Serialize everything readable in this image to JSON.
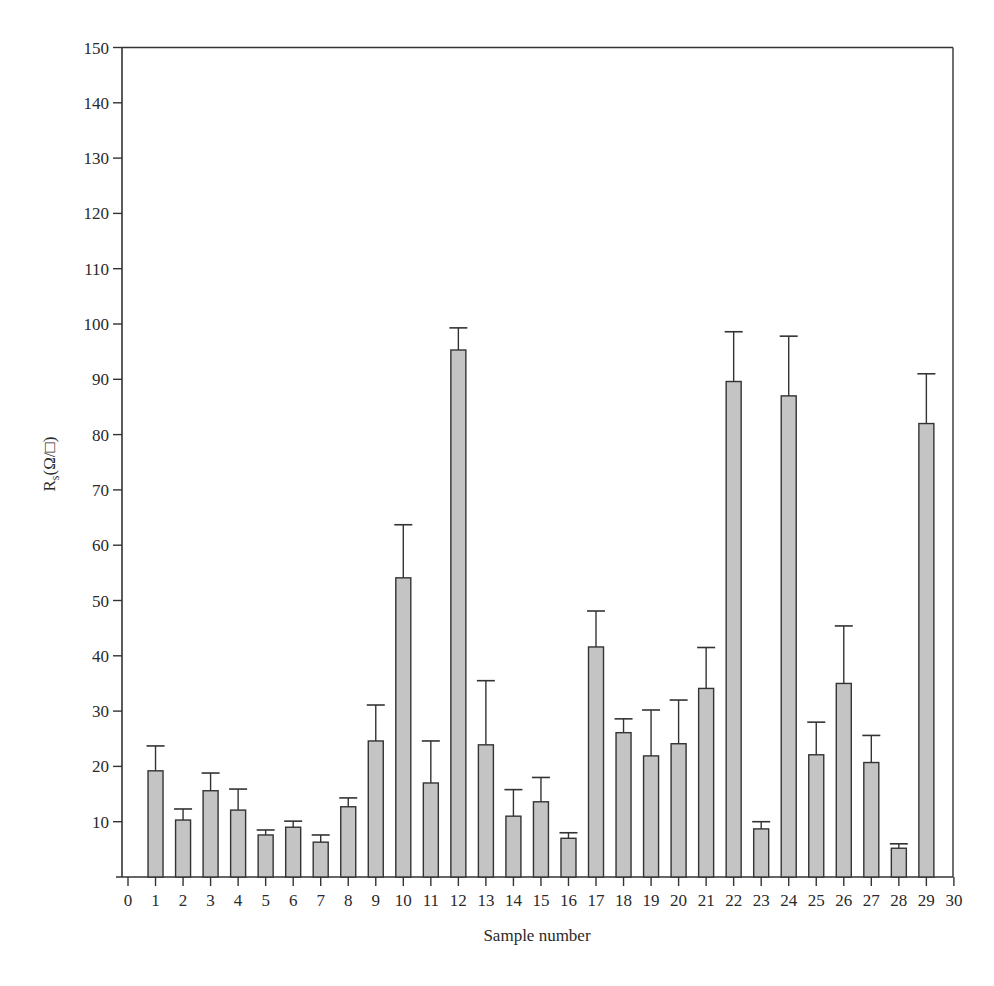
{
  "chart_data": {
    "type": "bar",
    "title": "",
    "xlabel": "Sample number",
    "ylabel": "R_s(Ω/□)",
    "ylabel_main": "R",
    "ylabel_sub": "s",
    "ylabel_rest": "(Ω/□)",
    "xlim": [
      0,
      30
    ],
    "ylim": [
      0,
      150
    ],
    "x_ticks": [
      0,
      1,
      2,
      3,
      4,
      5,
      6,
      7,
      8,
      9,
      10,
      11,
      12,
      13,
      14,
      15,
      16,
      17,
      18,
      19,
      20,
      21,
      22,
      23,
      24,
      25,
      26,
      27,
      28,
      29,
      30
    ],
    "y_ticks": [
      10,
      20,
      30,
      40,
      50,
      60,
      70,
      80,
      90,
      100,
      110,
      120,
      130,
      140,
      150
    ],
    "grid": false,
    "legend": null,
    "categories": [
      1,
      2,
      3,
      4,
      5,
      6,
      7,
      8,
      9,
      10,
      11,
      12,
      13,
      14,
      15,
      16,
      17,
      18,
      19,
      20,
      21,
      22,
      23,
      24,
      25,
      26,
      27,
      28,
      29
    ],
    "values": [
      19.2,
      10.3,
      15.6,
      12.1,
      7.6,
      9.0,
      6.3,
      12.7,
      24.6,
      54.1,
      17.0,
      95.3,
      23.9,
      11.0,
      13.6,
      7.0,
      41.6,
      26.1,
      21.9,
      24.1,
      34.1,
      89.6,
      8.7,
      87.0,
      22.1,
      35.0,
      20.7,
      5.2,
      82.0
    ],
    "error_upper": [
      23.7,
      12.3,
      18.8,
      15.9,
      8.5,
      10.1,
      7.6,
      14.3,
      31.1,
      63.7,
      24.6,
      99.3,
      35.5,
      15.8,
      18.0,
      8.0,
      48.1,
      28.6,
      30.2,
      32.0,
      41.5,
      98.6,
      10.0,
      97.8,
      28.0,
      45.4,
      25.6,
      6.0,
      91.0
    ],
    "colors": {
      "bar_fill": "#c4c4c4",
      "bar_stroke": "#333333",
      "axis": "#333333"
    }
  }
}
